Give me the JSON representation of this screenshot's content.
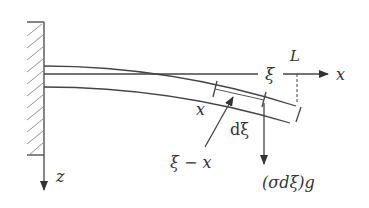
{
  "diagram": {
    "labels": {
      "xi_axis": "ξ",
      "L": "L",
      "x_axis": "x",
      "x_point": "x",
      "d_xi": "dξ",
      "xi_minus_x": "ξ − x",
      "force": "(σdξ)g",
      "z_axis": "z"
    },
    "elements": [
      "fixed-wall",
      "undeformed-beam",
      "deflected-beam",
      "beam-element-dxi",
      "x-axis-arrow",
      "z-axis-arrow",
      "gravity-force-arrow",
      "length-marker-dashed"
    ],
    "colors": {
      "stroke": "#444444",
      "hatch": "#888888",
      "text": "#333333",
      "background": "#ffffff"
    }
  }
}
